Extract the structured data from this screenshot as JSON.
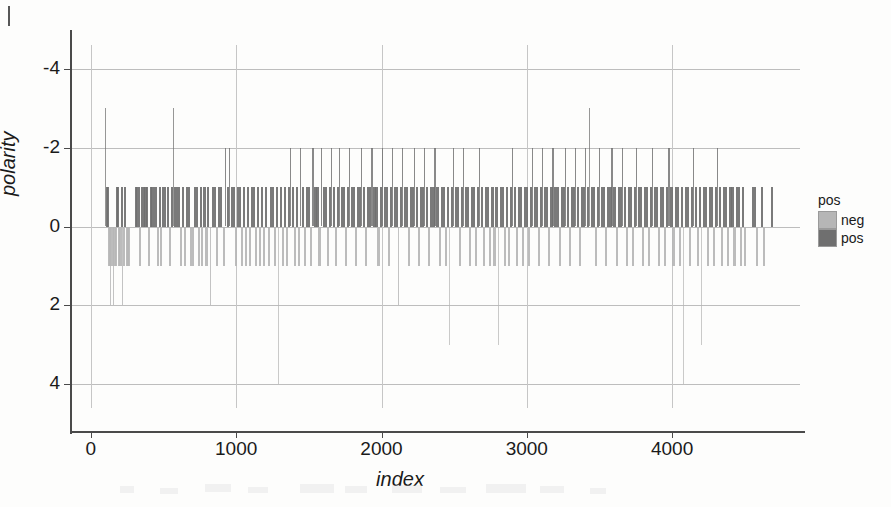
{
  "figure": {
    "axes": {
      "ylabel": "polarity",
      "xlabel": "index",
      "yticks": [
        "4",
        "2",
        "0",
        "-2",
        "-4"
      ],
      "xticks": [
        "0",
        "1000",
        "2000",
        "3000",
        "4000"
      ],
      "ylim": [
        -4.6,
        4.6
      ],
      "xlim": [
        -130,
        4880
      ],
      "grid": true
    },
    "legend": {
      "title": "pos",
      "position": "right",
      "entries": [
        {
          "label": "neg",
          "color": "#b6b6b6"
        },
        {
          "label": "pos",
          "color": "#6f6f6f"
        }
      ]
    }
  },
  "chart_data": {
    "type": "bar",
    "title": "",
    "xlabel": "index",
    "ylabel": "polarity",
    "xlim": [
      -130,
      4880
    ],
    "ylim": [
      -4.6,
      4.6
    ],
    "grid": true,
    "legend_title": "pos",
    "series": [
      {
        "name": "neg",
        "color": "#b6b6b6"
      },
      {
        "name": "pos",
        "color": "#6f6f6f"
      }
    ],
    "xticks": [
      0,
      1000,
      2000,
      3000,
      4000
    ],
    "yticks": [
      -4,
      -2,
      0,
      2,
      4
    ],
    "note": "vertical spike plot: one thin bar per document index; bar height = integer polarity score; bars above zero coloured pos (dark grey), below zero neg (light grey)",
    "points": [
      [
        95,
        3
      ],
      [
        104,
        1
      ],
      [
        112,
        1
      ],
      [
        118,
        -1
      ],
      [
        126,
        -1
      ],
      [
        133,
        -2
      ],
      [
        141,
        -1
      ],
      [
        150,
        -2
      ],
      [
        158,
        -1
      ],
      [
        165,
        -1
      ],
      [
        174,
        1
      ],
      [
        180,
        1
      ],
      [
        188,
        -1
      ],
      [
        196,
        -1
      ],
      [
        204,
        1
      ],
      [
        212,
        -2
      ],
      [
        220,
        -1
      ],
      [
        229,
        1
      ],
      [
        238,
        -1
      ],
      [
        246,
        -1
      ],
      [
        255,
        -1
      ],
      [
        300,
        1
      ],
      [
        312,
        1
      ],
      [
        322,
        1
      ],
      [
        333,
        -1
      ],
      [
        344,
        1
      ],
      [
        356,
        1
      ],
      [
        368,
        1
      ],
      [
        381,
        1
      ],
      [
        393,
        -1
      ],
      [
        404,
        1
      ],
      [
        415,
        1
      ],
      [
        428,
        1
      ],
      [
        440,
        1
      ],
      [
        452,
        -1
      ],
      [
        465,
        1
      ],
      [
        478,
        -1
      ],
      [
        490,
        1
      ],
      [
        504,
        1
      ],
      [
        520,
        1
      ],
      [
        534,
        -1
      ],
      [
        548,
        1
      ],
      [
        562,
        3
      ],
      [
        574,
        1
      ],
      [
        586,
        1
      ],
      [
        600,
        1
      ],
      [
        612,
        -1
      ],
      [
        626,
        1
      ],
      [
        640,
        -1
      ],
      [
        652,
        1
      ],
      [
        666,
        1
      ],
      [
        680,
        -1
      ],
      [
        694,
        -1
      ],
      [
        706,
        1
      ],
      [
        720,
        1
      ],
      [
        736,
        -1
      ],
      [
        748,
        1
      ],
      [
        760,
        -1
      ],
      [
        774,
        1
      ],
      [
        788,
        -1
      ],
      [
        800,
        1
      ],
      [
        816,
        -2
      ],
      [
        830,
        1
      ],
      [
        846,
        1
      ],
      [
        860,
        -1
      ],
      [
        874,
        1
      ],
      [
        890,
        1
      ],
      [
        906,
        -1
      ],
      [
        920,
        2
      ],
      [
        934,
        1
      ],
      [
        948,
        2
      ],
      [
        962,
        1
      ],
      [
        976,
        1
      ],
      [
        990,
        -1
      ],
      [
        1004,
        1
      ],
      [
        1018,
        1
      ],
      [
        1032,
        -1
      ],
      [
        1046,
        1
      ],
      [
        1060,
        -1
      ],
      [
        1074,
        1
      ],
      [
        1088,
        -1
      ],
      [
        1100,
        1
      ],
      [
        1116,
        1
      ],
      [
        1130,
        -1
      ],
      [
        1144,
        1
      ],
      [
        1158,
        -1
      ],
      [
        1172,
        1
      ],
      [
        1186,
        -1
      ],
      [
        1200,
        1
      ],
      [
        1216,
        -1
      ],
      [
        1230,
        1
      ],
      [
        1244,
        1
      ],
      [
        1258,
        -1
      ],
      [
        1272,
        1
      ],
      [
        1286,
        -4
      ],
      [
        1300,
        1
      ],
      [
        1314,
        -1
      ],
      [
        1328,
        1
      ],
      [
        1342,
        -1
      ],
      [
        1356,
        1
      ],
      [
        1370,
        2
      ],
      [
        1384,
        1
      ],
      [
        1398,
        -1
      ],
      [
        1412,
        1
      ],
      [
        1426,
        -1
      ],
      [
        1440,
        2
      ],
      [
        1454,
        1
      ],
      [
        1468,
        -1
      ],
      [
        1482,
        1
      ],
      [
        1496,
        1
      ],
      [
        1510,
        -1
      ],
      [
        1524,
        2
      ],
      [
        1538,
        1
      ],
      [
        1552,
        1
      ],
      [
        1566,
        -1
      ],
      [
        1580,
        2
      ],
      [
        1594,
        1
      ],
      [
        1608,
        1
      ],
      [
        1622,
        -1
      ],
      [
        1636,
        1
      ],
      [
        1650,
        2
      ],
      [
        1664,
        1
      ],
      [
        1678,
        -1
      ],
      [
        1692,
        1
      ],
      [
        1706,
        2
      ],
      [
        1720,
        1
      ],
      [
        1734,
        1
      ],
      [
        1748,
        -1
      ],
      [
        1762,
        1
      ],
      [
        1776,
        2
      ],
      [
        1790,
        1
      ],
      [
        1804,
        1
      ],
      [
        1818,
        -1
      ],
      [
        1832,
        1
      ],
      [
        1846,
        1
      ],
      [
        1860,
        2
      ],
      [
        1874,
        1
      ],
      [
        1888,
        -1
      ],
      [
        1902,
        1
      ],
      [
        1916,
        1
      ],
      [
        1930,
        2
      ],
      [
        1944,
        1
      ],
      [
        1958,
        1
      ],
      [
        1972,
        -1
      ],
      [
        1986,
        1
      ],
      [
        2000,
        2
      ],
      [
        2014,
        1
      ],
      [
        2028,
        1
      ],
      [
        2042,
        -1
      ],
      [
        2056,
        1
      ],
      [
        2070,
        2
      ],
      [
        2084,
        1
      ],
      [
        2098,
        1
      ],
      [
        2112,
        -2
      ],
      [
        2126,
        1
      ],
      [
        2140,
        2
      ],
      [
        2154,
        1
      ],
      [
        2168,
        1
      ],
      [
        2182,
        -1
      ],
      [
        2196,
        1
      ],
      [
        2210,
        1
      ],
      [
        2224,
        2
      ],
      [
        2238,
        1
      ],
      [
        2252,
        -1
      ],
      [
        2266,
        1
      ],
      [
        2280,
        1
      ],
      [
        2294,
        2
      ],
      [
        2308,
        1
      ],
      [
        2322,
        -1
      ],
      [
        2336,
        1
      ],
      [
        2350,
        1
      ],
      [
        2364,
        2
      ],
      [
        2378,
        1
      ],
      [
        2392,
        -1
      ],
      [
        2406,
        1
      ],
      [
        2420,
        1
      ],
      [
        2434,
        -1
      ],
      [
        2448,
        1
      ],
      [
        2462,
        -3
      ],
      [
        2476,
        1
      ],
      [
        2490,
        2
      ],
      [
        2504,
        1
      ],
      [
        2518,
        1
      ],
      [
        2532,
        -1
      ],
      [
        2546,
        1
      ],
      [
        2560,
        2
      ],
      [
        2574,
        1
      ],
      [
        2588,
        1
      ],
      [
        2602,
        -1
      ],
      [
        2616,
        1
      ],
      [
        2630,
        1
      ],
      [
        2644,
        -1
      ],
      [
        2658,
        1
      ],
      [
        2672,
        2
      ],
      [
        2686,
        1
      ],
      [
        2700,
        -1
      ],
      [
        2714,
        1
      ],
      [
        2728,
        1
      ],
      [
        2742,
        -1
      ],
      [
        2756,
        1
      ],
      [
        2770,
        -1
      ],
      [
        2784,
        1
      ],
      [
        2798,
        -3
      ],
      [
        2812,
        1
      ],
      [
        2826,
        1
      ],
      [
        2840,
        -1
      ],
      [
        2854,
        1
      ],
      [
        2868,
        -1
      ],
      [
        2882,
        1
      ],
      [
        2896,
        2
      ],
      [
        2910,
        1
      ],
      [
        2924,
        -1
      ],
      [
        2938,
        1
      ],
      [
        2952,
        1
      ],
      [
        2966,
        -1
      ],
      [
        2980,
        1
      ],
      [
        2994,
        1
      ],
      [
        3008,
        -1
      ],
      [
        3022,
        1
      ],
      [
        3036,
        2
      ],
      [
        3050,
        1
      ],
      [
        3064,
        1
      ],
      [
        3078,
        -1
      ],
      [
        3092,
        1
      ],
      [
        3106,
        2
      ],
      [
        3120,
        1
      ],
      [
        3134,
        1
      ],
      [
        3148,
        -1
      ],
      [
        3162,
        1
      ],
      [
        3176,
        2
      ],
      [
        3190,
        1
      ],
      [
        3204,
        1
      ],
      [
        3218,
        -1
      ],
      [
        3232,
        1
      ],
      [
        3246,
        1
      ],
      [
        3260,
        2
      ],
      [
        3274,
        1
      ],
      [
        3288,
        -1
      ],
      [
        3302,
        1
      ],
      [
        3316,
        1
      ],
      [
        3330,
        2
      ],
      [
        3344,
        1
      ],
      [
        3358,
        -1
      ],
      [
        3372,
        1
      ],
      [
        3386,
        1
      ],
      [
        3400,
        2
      ],
      [
        3414,
        1
      ],
      [
        3428,
        3
      ],
      [
        3442,
        1
      ],
      [
        3456,
        1
      ],
      [
        3470,
        -1
      ],
      [
        3484,
        1
      ],
      [
        3498,
        2
      ],
      [
        3512,
        1
      ],
      [
        3526,
        1
      ],
      [
        3540,
        -1
      ],
      [
        3554,
        1
      ],
      [
        3568,
        1
      ],
      [
        3582,
        2
      ],
      [
        3596,
        1
      ],
      [
        3610,
        -1
      ],
      [
        3624,
        1
      ],
      [
        3638,
        1
      ],
      [
        3652,
        2
      ],
      [
        3666,
        1
      ],
      [
        3680,
        -1
      ],
      [
        3694,
        1
      ],
      [
        3708,
        1
      ],
      [
        3722,
        -1
      ],
      [
        3736,
        1
      ],
      [
        3750,
        2
      ],
      [
        3764,
        1
      ],
      [
        3778,
        1
      ],
      [
        3792,
        -1
      ],
      [
        3806,
        1
      ],
      [
        3820,
        1
      ],
      [
        3834,
        -1
      ],
      [
        3848,
        1
      ],
      [
        3862,
        2
      ],
      [
        3876,
        1
      ],
      [
        3890,
        1
      ],
      [
        3904,
        -1
      ],
      [
        3918,
        1
      ],
      [
        3932,
        1
      ],
      [
        3946,
        -1
      ],
      [
        3960,
        1
      ],
      [
        3974,
        2
      ],
      [
        3988,
        1
      ],
      [
        4002,
        -1
      ],
      [
        4016,
        1
      ],
      [
        4030,
        1
      ],
      [
        4044,
        -1
      ],
      [
        4058,
        1
      ],
      [
        4072,
        -4
      ],
      [
        4086,
        1
      ],
      [
        4100,
        1
      ],
      [
        4114,
        -1
      ],
      [
        4128,
        1
      ],
      [
        4142,
        2
      ],
      [
        4156,
        1
      ],
      [
        4170,
        -1
      ],
      [
        4184,
        1
      ],
      [
        4198,
        -3
      ],
      [
        4212,
        1
      ],
      [
        4226,
        1
      ],
      [
        4240,
        -1
      ],
      [
        4254,
        1
      ],
      [
        4268,
        1
      ],
      [
        4282,
        -1
      ],
      [
        4296,
        1
      ],
      [
        4310,
        2
      ],
      [
        4324,
        1
      ],
      [
        4338,
        -1
      ],
      [
        4352,
        1
      ],
      [
        4366,
        1
      ],
      [
        4380,
        -1
      ],
      [
        4394,
        1
      ],
      [
        4408,
        1
      ],
      [
        4422,
        -1
      ],
      [
        4436,
        1
      ],
      [
        4450,
        1
      ],
      [
        4464,
        -1
      ],
      [
        4478,
        1
      ],
      [
        4492,
        -1
      ],
      [
        4550,
        1
      ],
      [
        4564,
        1
      ],
      [
        4578,
        -1
      ],
      [
        4610,
        1
      ],
      [
        4624,
        -1
      ],
      [
        4680,
        1
      ]
    ]
  }
}
